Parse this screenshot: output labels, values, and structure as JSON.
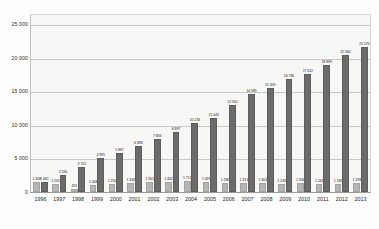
{
  "chart_data": {
    "type": "bar",
    "title": "",
    "subtitle": "",
    "xlabel": "",
    "ylabel": "",
    "ylim": [
      0,
      26500
    ],
    "yticks": [
      0,
      5000,
      10000,
      15000,
      20000,
      25000
    ],
    "ytick_labels": [
      "0",
      "5 000",
      "10 000",
      "15 000",
      "20 000",
      "25 000"
    ],
    "grid": true,
    "legend": "none",
    "categories": [
      "1996",
      "1997",
      "1998",
      "1999",
      "2000",
      "2001",
      "2002",
      "2003",
      "2004",
      "2005",
      "2006",
      "2007",
      "2008",
      "2009",
      "2010",
      "2011",
      "2012",
      "2013"
    ],
    "series": [
      {
        "name": "series-light",
        "color": "#b6b6b6",
        "values": [
          1458,
          1205,
          491,
          1048,
          1250,
          1336,
          1561,
          1462,
          1713,
          1499,
          1280,
          1313,
          1303,
          1243,
          1336,
          1244,
          1180,
          1298
        ],
        "labels": [
          "1 458",
          "1 205",
          "491",
          "1 048",
          "1 250",
          "1 336",
          "1 561",
          "1 462",
          "1 713",
          "1 499",
          "1 280",
          "1 313",
          "1 303",
          "1 243",
          "1 336",
          "1 244",
          "1 180",
          "1 298"
        ]
      },
      {
        "name": "series-dark",
        "color": "#6b6b6b",
        "values": [
          1462,
          2590,
          3702,
          4995,
          5867,
          6838,
          7856,
          8897,
          10233,
          11043,
          12901,
          14589,
          15509,
          16785,
          17612,
          18899,
          20362,
          21576
        ],
        "labels": [
          "1 462",
          "2 590",
          "3 702",
          "4 995",
          "5 867",
          "6 838",
          "7 856",
          "8 897",
          "10 233",
          "11 043",
          "12 901",
          "14 589",
          "15 509",
          "16 785",
          "17 612",
          "18 899",
          "20 362",
          "21 576"
        ]
      }
    ]
  },
  "colors": {
    "plot_background": "#f7f7f5",
    "gridline": "#c9c9c9",
    "axis": "#9a9a9a",
    "bar_light": "#b6b6b6",
    "bar_dark": "#6b6b6b",
    "text": "#1e1e1e"
  }
}
